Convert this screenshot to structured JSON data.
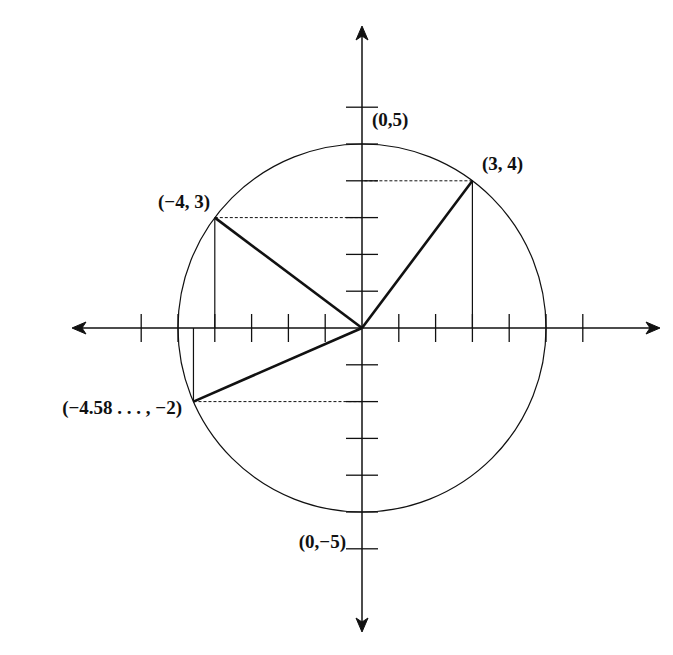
{
  "diagram": {
    "type": "coordinate-plane-circle",
    "origin_px": [
      362,
      328
    ],
    "unit_px": 36.8,
    "circle_radius": 5,
    "x_ticks": [
      -6,
      -5,
      -4,
      -3,
      -2,
      -1,
      1,
      2,
      3,
      4,
      5,
      6
    ],
    "y_ticks": [
      -6,
      -5,
      -4,
      -3,
      -2,
      -1,
      1,
      2,
      3,
      4,
      5,
      6
    ],
    "points": [
      {
        "id": "p1",
        "x": 3,
        "y": 4,
        "label": "(3, 4)"
      },
      {
        "id": "p2",
        "x": -4,
        "y": 3,
        "label": "(−4, 3)"
      },
      {
        "id": "p3",
        "x": -4.58,
        "y": -2,
        "label": "(−4.58 . . . , −2)"
      }
    ],
    "axis_labels": {
      "top": "(0,5)",
      "bottom": "(0,−5)"
    },
    "colors": {
      "stroke": "#111111",
      "background": "#ffffff"
    }
  }
}
